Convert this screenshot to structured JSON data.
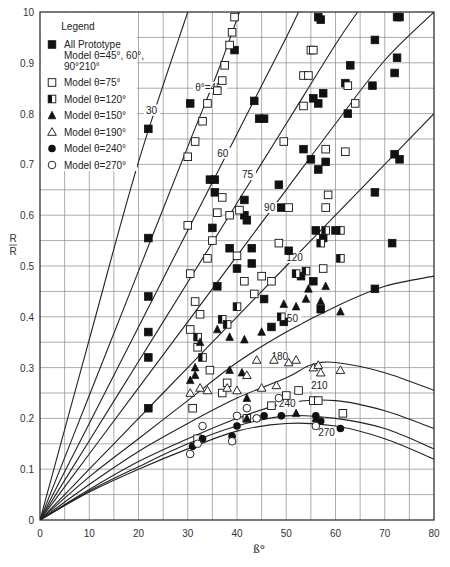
{
  "chart_data": {
    "type": "scatter",
    "title": "",
    "xlabel": "ß°",
    "ylabel_num": "R",
    "ylabel_den": "R",
    "xlim": [
      0,
      80
    ],
    "ylim": [
      0,
      1.0
    ],
    "grid": true,
    "x_ticks": [
      0,
      10,
      20,
      30,
      40,
      50,
      60,
      70,
      80
    ],
    "x_tick_labels": [
      "0",
      "10",
      "20",
      "30",
      "40",
      "50",
      "60",
      "70",
      "80"
    ],
    "y_ticks": [
      0,
      0.1,
      0.2,
      0.3,
      0.4,
      0.5,
      0.6,
      0.7,
      0.8,
      0.9,
      1.0
    ],
    "y_tick_labels": [
      "0",
      "0.1",
      "0.2",
      "0.3",
      "0.4",
      "0.5",
      "0.6",
      "0.7",
      "0.8",
      "0.9",
      "10"
    ],
    "legend": {
      "title": "Legend",
      "placement": "top-left",
      "entries": [
        {
          "marker": "filled-square",
          "lines": [
            "All Prototype",
            "Model θ=45°, 60°,",
            "90°210°"
          ]
        },
        {
          "marker": "open-square",
          "lines": [
            "Model θ=75°"
          ]
        },
        {
          "marker": "half-square",
          "lines": [
            "Model θ=120°"
          ]
        },
        {
          "marker": "filled-triangle",
          "lines": [
            "Model θ=150°"
          ]
        },
        {
          "marker": "open-triangle",
          "lines": [
            "Model θ=190°"
          ]
        },
        {
          "marker": "filled-circle",
          "lines": [
            "Model θ=240°"
          ]
        },
        {
          "marker": "open-circle",
          "lines": [
            "Model θ=270°"
          ]
        }
      ]
    },
    "curves": [
      {
        "label": "30",
        "label_at": [
          21.5,
          0.8
        ],
        "points": [
          [
            0,
            0
          ],
          [
            10,
            0.355
          ],
          [
            20,
            0.705
          ],
          [
            30,
            1.0
          ]
        ]
      },
      {
        "label": "θ°=45",
        "label_at": [
          31.5,
          0.845
        ],
        "points": [
          [
            0,
            0
          ],
          [
            10,
            0.245
          ],
          [
            20,
            0.49
          ],
          [
            30,
            0.735
          ],
          [
            36,
            0.88
          ],
          [
            40.5,
            1.0
          ]
        ]
      },
      {
        "label": "60",
        "label_at": [
          36,
          0.715
        ],
        "points": [
          [
            0,
            0
          ],
          [
            10,
            0.19
          ],
          [
            20,
            0.38
          ],
          [
            30,
            0.57
          ],
          [
            40,
            0.76
          ],
          [
            50,
            0.95
          ],
          [
            52.5,
            1.0
          ]
        ]
      },
      {
        "label": "75",
        "label_at": [
          41,
          0.673
        ],
        "points": [
          [
            0,
            0
          ],
          [
            10,
            0.156
          ],
          [
            20,
            0.312
          ],
          [
            30,
            0.468
          ],
          [
            40,
            0.624
          ],
          [
            50,
            0.78
          ],
          [
            60,
            0.936
          ],
          [
            64.5,
            1.0
          ]
        ]
      },
      {
        "label": "90",
        "label_at": [
          45.5,
          0.608
        ],
        "points": [
          [
            0,
            0
          ],
          [
            10,
            0.13
          ],
          [
            20,
            0.26
          ],
          [
            30,
            0.39
          ],
          [
            40,
            0.52
          ],
          [
            50,
            0.65
          ],
          [
            60,
            0.78
          ],
          [
            70,
            0.905
          ],
          [
            80,
            1.0
          ]
        ]
      },
      {
        "label": "120",
        "label_at": [
          50,
          0.51
        ],
        "points": [
          [
            0,
            0
          ],
          [
            10,
            0.1
          ],
          [
            20,
            0.2
          ],
          [
            30,
            0.3
          ],
          [
            40,
            0.4
          ],
          [
            50,
            0.5
          ],
          [
            60,
            0.6
          ],
          [
            70,
            0.7
          ],
          [
            80,
            0.8
          ]
        ]
      },
      {
        "label": "150",
        "label_at": [
          49,
          0.39
        ],
        "points": [
          [
            0,
            0
          ],
          [
            10,
            0.085
          ],
          [
            20,
            0.16
          ],
          [
            30,
            0.235
          ],
          [
            40,
            0.31
          ],
          [
            50,
            0.37
          ],
          [
            60,
            0.42
          ],
          [
            70,
            0.46
          ],
          [
            80,
            0.48
          ]
        ]
      },
      {
        "label": "180",
        "label_at": [
          47,
          0.315
        ],
        "points": [
          [
            0,
            0
          ],
          [
            10,
            0.07
          ],
          [
            20,
            0.135
          ],
          [
            30,
            0.19
          ],
          [
            40,
            0.24
          ],
          [
            50,
            0.28
          ],
          [
            55,
            0.305
          ],
          [
            60,
            0.31
          ],
          [
            70,
            0.29
          ],
          [
            80,
            0.255
          ]
        ]
      },
      {
        "label": "210",
        "label_at": [
          55,
          0.258
        ],
        "points": [
          [
            0,
            0
          ],
          [
            10,
            0.06
          ],
          [
            20,
            0.115
          ],
          [
            30,
            0.16
          ],
          [
            40,
            0.2
          ],
          [
            50,
            0.23
          ],
          [
            60,
            0.235
          ],
          [
            70,
            0.215
          ],
          [
            80,
            0.18
          ]
        ]
      },
      {
        "label": "240",
        "label_at": [
          48.5,
          0.223
        ],
        "points": [
          [
            0,
            0
          ],
          [
            10,
            0.057
          ],
          [
            20,
            0.105
          ],
          [
            30,
            0.15
          ],
          [
            40,
            0.185
          ],
          [
            50,
            0.205
          ],
          [
            60,
            0.2
          ],
          [
            70,
            0.18
          ],
          [
            80,
            0.14
          ]
        ]
      },
      {
        "label": "270",
        "label_at": [
          56.5,
          0.165
        ],
        "points": [
          [
            0,
            0
          ],
          [
            10,
            0.055
          ],
          [
            20,
            0.1
          ],
          [
            30,
            0.14
          ],
          [
            40,
            0.175
          ],
          [
            50,
            0.19
          ],
          [
            60,
            0.185
          ],
          [
            70,
            0.16
          ],
          [
            80,
            0.12
          ]
        ]
      }
    ],
    "series": [
      {
        "name": "All Prototype Model θ=45°, 60°, 90°210°",
        "marker": "filled-square",
        "points": [
          [
            22,
            0.77
          ],
          [
            22,
            0.555
          ],
          [
            22,
            0.44
          ],
          [
            22,
            0.37
          ],
          [
            22,
            0.32
          ],
          [
            22,
            0.22
          ],
          [
            30.5,
            0.82
          ],
          [
            34.5,
            0.67
          ],
          [
            35.5,
            0.67
          ],
          [
            35.5,
            0.645
          ],
          [
            39.5,
            0.925
          ],
          [
            41.5,
            0.63
          ],
          [
            41.5,
            0.6
          ],
          [
            42,
            0.59
          ],
          [
            44.5,
            0.79
          ],
          [
            45.5,
            0.79
          ],
          [
            49,
            0.615
          ],
          [
            53.5,
            0.73
          ],
          [
            56.5,
            0.99
          ],
          [
            57,
            0.985
          ],
          [
            56.5,
            0.69
          ],
          [
            56,
            0.57
          ],
          [
            63,
            0.895
          ],
          [
            62,
            0.86
          ],
          [
            62.5,
            0.8
          ],
          [
            67.5,
            0.855
          ],
          [
            72.5,
            0.99
          ],
          [
            73,
            0.99
          ],
          [
            72.5,
            0.91
          ],
          [
            72,
            0.88
          ],
          [
            68,
            0.945
          ],
          [
            72,
            0.72
          ],
          [
            73,
            0.71
          ],
          [
            71.5,
            0.545
          ],
          [
            68,
            0.645
          ],
          [
            57.5,
            0.555
          ],
          [
            50.5,
            0.53
          ],
          [
            49.5,
            0.39
          ],
          [
            53,
            0.48
          ],
          [
            55.5,
            0.47
          ],
          [
            43,
            0.505
          ],
          [
            43,
            0.535
          ],
          [
            40,
            0.495
          ],
          [
            38.5,
            0.535
          ],
          [
            35,
            0.575
          ],
          [
            36,
            0.46
          ],
          [
            45.5,
            0.435
          ],
          [
            47,
            0.38
          ],
          [
            57,
            0.415
          ],
          [
            68,
            0.455
          ],
          [
            56.5,
            0.82
          ],
          [
            55.5,
            0.83
          ],
          [
            57.5,
            0.84
          ],
          [
            58,
            0.705
          ],
          [
            55,
            0.71
          ],
          [
            60,
            0.57
          ],
          [
            48.5,
            0.66
          ],
          [
            43.5,
            0.825
          ]
        ]
      },
      {
        "name": "Model θ=75°",
        "marker": "open-square",
        "points": [
          [
            30,
            0.715
          ],
          [
            31.5,
            0.745
          ],
          [
            33,
            0.785
          ],
          [
            34,
            0.82
          ],
          [
            36,
            0.845
          ],
          [
            37,
            0.865
          ],
          [
            37.5,
            0.895
          ],
          [
            38.5,
            0.935
          ],
          [
            39,
            0.96
          ],
          [
            39.5,
            0.99
          ],
          [
            30,
            0.58
          ],
          [
            30.5,
            0.485
          ],
          [
            31.5,
            0.43
          ],
          [
            32.5,
            0.405
          ],
          [
            34,
            0.515
          ],
          [
            35,
            0.55
          ],
          [
            36,
            0.605
          ],
          [
            37,
            0.635
          ],
          [
            38.5,
            0.6
          ],
          [
            40.5,
            0.61
          ],
          [
            30.5,
            0.375
          ],
          [
            32,
            0.34
          ],
          [
            34.5,
            0.295
          ],
          [
            38,
            0.27
          ],
          [
            40,
            0.52
          ],
          [
            41.5,
            0.47
          ],
          [
            43.5,
            0.445
          ],
          [
            45,
            0.48
          ],
          [
            47,
            0.47
          ],
          [
            48.5,
            0.545
          ],
          [
            49.5,
            0.745
          ],
          [
            50.5,
            0.615
          ],
          [
            53.5,
            0.875
          ],
          [
            54.5,
            0.875
          ],
          [
            55,
            0.925
          ],
          [
            55.5,
            0.925
          ],
          [
            58,
            0.615
          ],
          [
            58.5,
            0.64
          ],
          [
            58,
            0.73
          ],
          [
            62.5,
            0.855
          ],
          [
            64,
            0.82
          ],
          [
            62,
            0.725
          ],
          [
            57.5,
            0.495
          ],
          [
            53.5,
            0.815
          ],
          [
            31,
            0.22
          ],
          [
            32,
            0.16
          ],
          [
            37,
            0.25
          ],
          [
            42,
            0.2
          ],
          [
            47,
            0.225
          ],
          [
            50,
            0.245
          ],
          [
            52.5,
            0.255
          ],
          [
            55.5,
            0.235
          ],
          [
            56.5,
            0.235
          ],
          [
            61.5,
            0.21
          ]
        ]
      },
      {
        "name": "Model θ=120°",
        "marker": "half-square",
        "points": [
          [
            32,
            0.36
          ],
          [
            37,
            0.395
          ],
          [
            38,
            0.385
          ],
          [
            33,
            0.32
          ],
          [
            40,
            0.42
          ],
          [
            49,
            0.4
          ],
          [
            52,
            0.485
          ],
          [
            54,
            0.49
          ],
          [
            57,
            0.545
          ],
          [
            58,
            0.57
          ],
          [
            61,
            0.515
          ],
          [
            61,
            0.57
          ]
        ]
      },
      {
        "name": "Model θ=150°",
        "marker": "filled-triangle",
        "points": [
          [
            30.5,
            0.275
          ],
          [
            31.5,
            0.285
          ],
          [
            31.5,
            0.3
          ],
          [
            32.5,
            0.35
          ],
          [
            36,
            0.375
          ],
          [
            38.5,
            0.36
          ],
          [
            41.5,
            0.355
          ],
          [
            38.5,
            0.295
          ],
          [
            41,
            0.29
          ],
          [
            45,
            0.37
          ],
          [
            49.5,
            0.425
          ],
          [
            52,
            0.42
          ],
          [
            54,
            0.435
          ],
          [
            54.5,
            0.455
          ],
          [
            57,
            0.43
          ],
          [
            58,
            0.46
          ],
          [
            61,
            0.41
          ],
          [
            52,
            0.21
          ],
          [
            56,
            0.2
          ],
          [
            42,
            0.24
          ],
          [
            42,
            0.2
          ]
        ]
      },
      {
        "name": "Model θ=190°",
        "marker": "open-triangle",
        "points": [
          [
            30.5,
            0.25
          ],
          [
            32.5,
            0.26
          ],
          [
            34,
            0.255
          ],
          [
            38,
            0.26
          ],
          [
            40,
            0.255
          ],
          [
            42,
            0.285
          ],
          [
            45,
            0.26
          ],
          [
            48,
            0.265
          ],
          [
            44,
            0.315
          ],
          [
            47.5,
            0.315
          ],
          [
            50.5,
            0.31
          ],
          [
            52,
            0.315
          ],
          [
            55.5,
            0.3
          ],
          [
            56.5,
            0.305
          ],
          [
            57,
            0.29
          ],
          [
            61,
            0.295
          ]
        ]
      },
      {
        "name": "Model θ=240°",
        "marker": "filled-circle",
        "points": [
          [
            31,
            0.145
          ],
          [
            33,
            0.16
          ],
          [
            39,
            0.165
          ],
          [
            40,
            0.185
          ],
          [
            44,
            0.2
          ],
          [
            45.5,
            0.205
          ],
          [
            49,
            0.205
          ],
          [
            56,
            0.205
          ],
          [
            57,
            0.195
          ],
          [
            61,
            0.18
          ]
        ]
      },
      {
        "name": "Model θ=270°",
        "marker": "open-circle",
        "points": [
          [
            30.5,
            0.13
          ],
          [
            32,
            0.15
          ],
          [
            33,
            0.185
          ],
          [
            39,
            0.155
          ],
          [
            40,
            0.205
          ],
          [
            42,
            0.22
          ],
          [
            44,
            0.2
          ],
          [
            48.5,
            0.24
          ],
          [
            56,
            0.185
          ]
        ]
      }
    ]
  }
}
